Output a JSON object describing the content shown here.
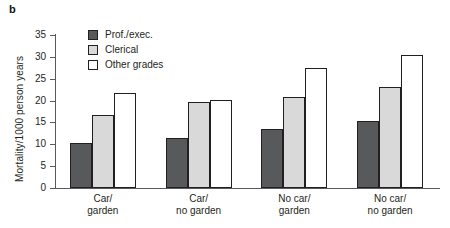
{
  "figure": {
    "panel_letter": "b"
  },
  "chart_data": {
    "type": "bar",
    "title": "",
    "xlabel": "",
    "ylabel": "Mortality/1000 person years",
    "ylim": [
      0,
      35
    ],
    "yticks": [
      0,
      5,
      10,
      15,
      20,
      25,
      30,
      35
    ],
    "ytick_labels": [
      "0",
      "5",
      "10",
      "15",
      "20",
      "25",
      "30",
      "35"
    ],
    "grid": false,
    "legend_position": "top-left-inside",
    "categories": [
      "Car/ garden",
      "Car/ no garden",
      "No car/ garden",
      "No car/ no garden"
    ],
    "category_lines": [
      [
        "Car/",
        "garden"
      ],
      [
        "Car/",
        "no garden"
      ],
      [
        "No car/",
        "garden"
      ],
      [
        "No car/",
        "no garden"
      ]
    ],
    "series": [
      {
        "name": "Prof./exec.",
        "color": "#58595b",
        "values": [
          10.3,
          11.5,
          13.4,
          15.4
        ]
      },
      {
        "name": "Clerical",
        "color": "#d9d9d9",
        "values": [
          16.8,
          19.7,
          20.8,
          23.2
        ]
      },
      {
        "name": "Other grades",
        "color": "#ffffff",
        "values": [
          21.8,
          20.2,
          27.5,
          30.5
        ]
      }
    ]
  }
}
